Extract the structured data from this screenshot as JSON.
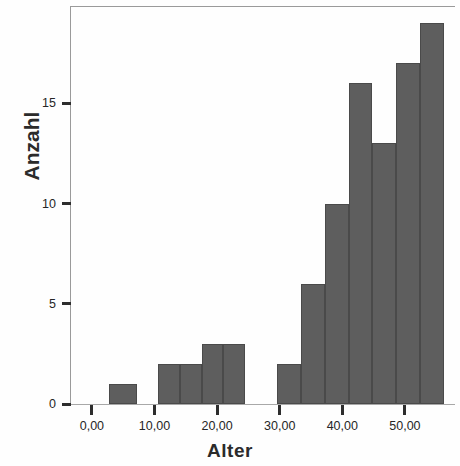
{
  "chart_data": {
    "type": "bar",
    "title": "",
    "xlabel": "Alter",
    "ylabel": "Anzahl",
    "xlim": [
      -3.5,
      58
    ],
    "ylim": [
      0,
      19.8
    ],
    "grid": false,
    "legend": null,
    "x_tick_labels": [
      "0,00",
      "10,00",
      "20,00",
      "30,00",
      "40,00",
      "50,00"
    ],
    "x_tick_values": [
      0,
      10,
      20,
      30,
      40,
      50
    ],
    "y_tick_labels": [
      "0",
      "5",
      "10",
      "15"
    ],
    "y_tick_values": [
      0,
      5,
      10,
      15
    ],
    "bar_color": "#5e5e5e",
    "bin_edges": [
      2.7,
      7.2,
      10.6,
      14.1,
      17.6,
      21.0,
      24.5,
      29.6,
      33.4,
      37.2,
      41.0,
      44.8,
      48.6,
      52.4,
      56.3
    ],
    "categories": [
      "2,7-7,2",
      "10,6-14,1",
      "14,1-17,6",
      "17,6-21,0",
      "21,0-24,5",
      "29,6-33,4",
      "33,4-37,2",
      "37,2-41,0",
      "41,0-44,8",
      "44,8-48,6",
      "48,6-52,4",
      "52,4-56,3"
    ],
    "values": [
      1,
      2,
      2,
      3,
      3,
      2,
      6,
      10,
      16,
      13,
      17,
      19
    ],
    "bars": [
      {
        "label": "2,7-7,2",
        "value": 1,
        "x0": 2.7,
        "x1": 7.2
      },
      {
        "label": "10,6-14,1",
        "value": 2,
        "x0": 10.6,
        "x1": 14.1
      },
      {
        "label": "14,1-17,6",
        "value": 2,
        "x0": 14.1,
        "x1": 17.6
      },
      {
        "label": "17,6-21,0",
        "value": 3,
        "x0": 17.6,
        "x1": 21.0
      },
      {
        "label": "21,0-24,5",
        "value": 3,
        "x0": 21.0,
        "x1": 24.5
      },
      {
        "label": "29,6-33,4",
        "value": 2,
        "x0": 29.6,
        "x1": 33.4
      },
      {
        "label": "33,4-37,2",
        "value": 6,
        "x0": 33.4,
        "x1": 37.2
      },
      {
        "label": "37,2-41,0",
        "value": 10,
        "x0": 37.2,
        "x1": 41.0
      },
      {
        "label": "41,0-44,8",
        "value": 16,
        "x0": 41.0,
        "x1": 44.8
      },
      {
        "label": "44,8-48,6",
        "value": 13,
        "x0": 44.8,
        "x1": 48.6
      },
      {
        "label": "48,6-52,4",
        "value": 17,
        "x0": 48.6,
        "x1": 52.4
      },
      {
        "label": "52,4-56,3",
        "value": 19,
        "x0": 52.4,
        "x1": 56.3
      }
    ]
  }
}
